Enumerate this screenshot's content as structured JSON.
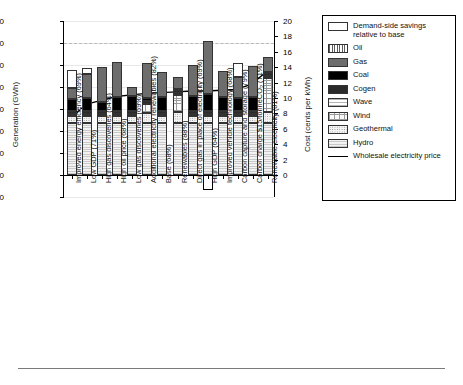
{
  "chart_data": {
    "type": "bar",
    "subtype": "stacked-bar-with-line",
    "title": "",
    "xlabel": "",
    "ylabel": "Generation (GWh)",
    "y2label": "Cost (cents per kWh)",
    "ylim": [
      -10000,
      70000
    ],
    "ytick_step": 10000,
    "yticks": [
      -10000,
      0,
      10000,
      20000,
      30000,
      40000,
      50000,
      60000,
      70000
    ],
    "ytick_labels": [
      "-10,000",
      "0",
      "10,000",
      "20,000",
      "30,000",
      "40,000",
      "50,000",
      "60,000",
      "70,000"
    ],
    "y2lim": [
      0,
      20
    ],
    "y2tick_step": 2,
    "y2ticks": [
      0,
      2,
      4,
      6,
      8,
      10,
      12,
      14,
      16,
      18,
      20
    ],
    "y2tick_labels": [
      "0",
      "2",
      "4",
      "6",
      "8",
      "10",
      "12",
      "14",
      "16",
      "18",
      "20"
    ],
    "grid": true,
    "reference_line": {
      "value": 60000,
      "style": "dashed"
    },
    "legend_position": "right-outside",
    "categories": [
      "Improved energy efficiency (69%)",
      "Low GDP (71%)",
      "High gas discoveries (64%)",
      "High oil price (68%)",
      "Low gas discoveries (69%)",
      "Additional electricity renewables (82%)",
      "Base (68%)",
      "Renewables (88%)",
      "Direct gas in place of electricity (69%)",
      "High GDP (64%)",
      "Improved vehicle technology (68%)",
      "Carbon capture and storage (79%)",
      "Carbon charge $15/tonneCO2 (71%)",
      "Renewable electricity (81%)"
    ],
    "series": [
      {
        "name": "Hydro",
        "values": [
          23500,
          23500,
          23500,
          23500,
          23500,
          23500,
          23500,
          23500,
          23500,
          23500,
          23500,
          23500,
          23500,
          23500
        ]
      },
      {
        "name": "Geothermal",
        "values": [
          3200,
          3200,
          3200,
          3200,
          3200,
          4700,
          3200,
          5200,
          3200,
          3200,
          3200,
          3200,
          3200,
          5200
        ]
      },
      {
        "name": "Wind",
        "values": [
          1100,
          1100,
          1100,
          1100,
          1100,
          4200,
          1100,
          7800,
          1100,
          1100,
          1100,
          1100,
          1100,
          15500
        ]
      },
      {
        "name": "Wave",
        "values": [
          0,
          0,
          0,
          0,
          0,
          0,
          0,
          700,
          0,
          0,
          0,
          0,
          0,
          900
        ]
      },
      {
        "name": "Cogen",
        "values": [
          1400,
          1400,
          1400,
          1400,
          1400,
          1400,
          1400,
          1400,
          1400,
          1400,
          1400,
          1400,
          1400,
          1400
        ]
      },
      {
        "name": "Coal",
        "values": [
          5300,
          5800,
          4200,
          6400,
          6500,
          1200,
          6300,
          400,
          6500,
          7600,
          6300,
          5600,
          6300,
          500
        ]
      },
      {
        "name": "Gas",
        "values": [
          5200,
          10800,
          15900,
          15600,
          4400,
          15800,
          11400,
          5600,
          14400,
          24000,
          11800,
          9600,
          14000,
          6600
        ]
      },
      {
        "name": "Oil",
        "values": [
          0,
          0,
          0,
          0,
          0,
          0,
          0,
          0,
          0,
          0,
          0,
          0,
          0,
          0
        ]
      },
      {
        "name": "Demand-side savings relative to base",
        "values": [
          7900,
          3000,
          0,
          0,
          0,
          0,
          0,
          0,
          0,
          -6900,
          0,
          6500,
          0,
          0
        ]
      }
    ],
    "line_series": {
      "name": "Wholesale electricity price",
      "axis": "right",
      "unit": "cents per kWh",
      "values": [
        7.5,
        9.2,
        9.7,
        10.2,
        10.4,
        10.6,
        10.7,
        10.8,
        10.9,
        10.9,
        11.0,
        11.1,
        11.8,
        13.4
      ]
    }
  },
  "legend": {
    "items": [
      {
        "label": "Demand-side savings relative to base",
        "swatch": "savings"
      },
      {
        "label": "Oil",
        "swatch": "oil"
      },
      {
        "label": "Gas",
        "swatch": "gas"
      },
      {
        "label": "Coal",
        "swatch": "coal"
      },
      {
        "label": "Cogen",
        "swatch": "cogen"
      },
      {
        "label": "Wave",
        "swatch": "wave"
      },
      {
        "label": "Wind",
        "swatch": "wind"
      },
      {
        "label": "Geothermal",
        "swatch": "geo"
      },
      {
        "label": "Hydro",
        "swatch": "hydro"
      },
      {
        "label": "Wholesale electricity price",
        "swatch": "line"
      }
    ]
  }
}
